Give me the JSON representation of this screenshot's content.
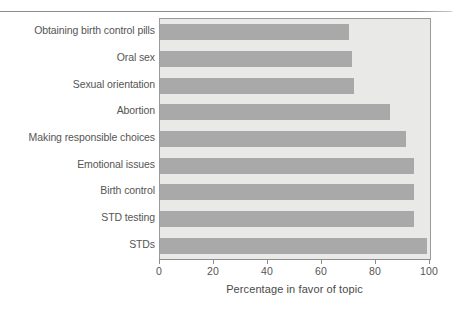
{
  "chart_data": {
    "type": "bar",
    "orientation": "horizontal",
    "title": "",
    "xlabel": "Percentage in favor of topic",
    "ylabel": "",
    "xlim": [
      0,
      100
    ],
    "xticks": [
      "0",
      "20",
      "40",
      "60",
      "80",
      "100"
    ],
    "xtick_values": [
      0,
      20,
      40,
      60,
      80,
      100
    ],
    "grid": false,
    "legend": null,
    "bar_color": "#a9a9a9",
    "plot_background": "#e9e9e7",
    "categories": [
      "Obtaining birth control pills",
      "Oral sex",
      "Sexual orientation",
      "Abortion",
      "Making responsible choices",
      "Emotional issues",
      "Birth control",
      "STD testing",
      "STDs"
    ],
    "values": [
      70,
      71,
      72,
      85,
      91,
      94,
      94,
      94,
      99
    ]
  }
}
